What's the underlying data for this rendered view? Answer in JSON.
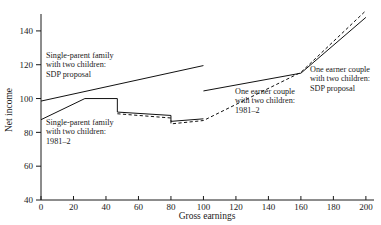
{
  "chart_data": {
    "type": "line",
    "title": "",
    "xlabel": "Gross earnings",
    "ylabel": "Net income",
    "xlim": [
      0,
      205
    ],
    "ylim": [
      40,
      150
    ],
    "grid": false,
    "legend_position": "inline-annotations",
    "xticks": [
      0,
      20,
      40,
      60,
      80,
      100,
      120,
      140,
      160,
      180,
      200
    ],
    "yticks": [
      40,
      60,
      80,
      100,
      120,
      140
    ],
    "xtick_labels": [
      "0",
      "20",
      "40",
      "60",
      "80",
      "100",
      "120",
      "140",
      "160",
      "180",
      "200"
    ],
    "ytick_labels": [
      "40",
      "60",
      "80",
      "100",
      "120",
      "140"
    ],
    "series": [
      {
        "name": "Single-parent family with two children: SDP proposal",
        "style": "solid",
        "points": [
          [
            0,
            98.5
          ],
          [
            100,
            119.5
          ]
        ]
      },
      {
        "name": "Single-parent family with two children: 1981-2",
        "style": "solid",
        "points": [
          [
            0,
            87.5
          ],
          [
            27,
            100.0
          ],
          [
            47,
            100.0
          ],
          [
            47,
            92.0
          ],
          [
            80,
            90.0
          ],
          [
            80,
            86.5
          ],
          [
            100,
            88.0
          ]
        ]
      },
      {
        "name": "One earner couple with two children: SDP proposal",
        "style": "solid",
        "points": [
          [
            100,
            104.5
          ],
          [
            160,
            115.0
          ],
          [
            200,
            148.0
          ]
        ]
      },
      {
        "name": "One earner couple with two children: 1981-2",
        "style": "dashed",
        "points": [
          [
            47,
            91.0
          ],
          [
            80,
            88.5
          ],
          [
            80,
            85.0
          ],
          [
            100,
            87.0
          ],
          [
            160,
            115.5
          ],
          [
            200,
            152.0
          ]
        ]
      }
    ],
    "annotations": [
      {
        "id": "annot-single-parent-sdp",
        "lines": [
          "Single-parent family",
          "with two children:",
          "SDP proposal"
        ],
        "x_px": 46,
        "y_px": 58
      },
      {
        "id": "annot-single-parent-1981",
        "lines": [
          "Single-parent family",
          "with two children:",
          "1981–2"
        ],
        "x_px": 46,
        "y_px": 125
      },
      {
        "id": "annot-one-earner-sdp",
        "lines": [
          "One earner couple",
          "with two children:",
          "SDP proposal"
        ],
        "x_px": 310,
        "y_px": 72
      },
      {
        "id": "annot-one-earner-1981",
        "lines": [
          "One earner couple",
          "with two children:",
          "1981–2"
        ],
        "x_px": 235,
        "y_px": 94
      }
    ],
    "colors": {
      "line": "#111111",
      "axis": "#1a1a1a",
      "background": "#ffffff",
      "text": "#1a1a1a"
    }
  }
}
